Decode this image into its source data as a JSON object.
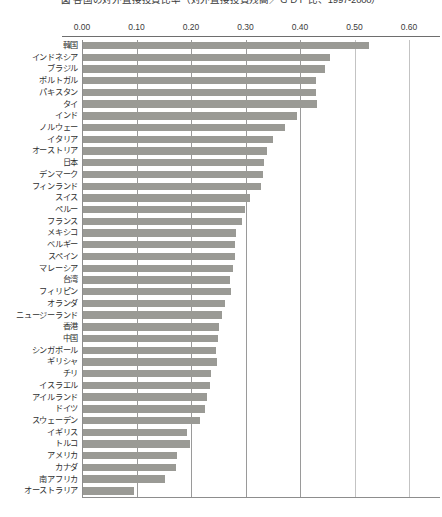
{
  "chart_title": "図 各国の対外直接投資比率（対外直接投資残高／ＧＤＰ比、1997-2000）",
  "axis": {
    "ticks": [
      "0.00",
      "0.10",
      "0.20",
      "0.30",
      "0.40",
      "0.50",
      "0.60"
    ],
    "tick_values": [
      0.0,
      0.1,
      0.2,
      0.3,
      0.4,
      0.5,
      0.6
    ]
  },
  "chart_data": {
    "type": "bar",
    "orientation": "horizontal",
    "title": "図 各国の対外直接投資比率（対外直接投資残高／ＧＤＰ比、1997-2000）",
    "xlabel": "",
    "ylabel": "",
    "xlim": [
      0.0,
      0.6
    ],
    "grid": true,
    "legend": "none",
    "categories": [
      "韓国",
      "インドネシア",
      "ブラジル",
      "ポルトガル",
      "パキスタン",
      "タイ",
      "インド",
      "ノルウェー",
      "イタリア",
      "オーストリア",
      "日本",
      "デンマーク",
      "フィンランド",
      "スイス",
      "ペルー",
      "フランス",
      "メキシコ",
      "ベルギー",
      "スペイン",
      "マレーシア",
      "台湾",
      "フィリピン",
      "オランダ",
      "ニュージーランド",
      "香港",
      "中国",
      "シンガポール",
      "ギリシャ",
      "チリ",
      "イスラエル",
      "アイルランド",
      "ドイツ",
      "スウェーデン",
      "イギリス",
      "トルコ",
      "アメリカ",
      "カナダ",
      "南アフリカ",
      "オーストラリア"
    ],
    "values": [
      0.525,
      0.453,
      0.444,
      0.427,
      0.427,
      0.429,
      0.393,
      0.37,
      0.348,
      0.337,
      0.332,
      0.33,
      0.326,
      0.307,
      0.298,
      0.291,
      0.281,
      0.278,
      0.278,
      0.276,
      0.27,
      0.272,
      0.261,
      0.255,
      0.25,
      0.248,
      0.244,
      0.246,
      0.235,
      0.233,
      0.228,
      0.224,
      0.215,
      0.191,
      0.196,
      0.172,
      0.17,
      0.15,
      0.093
    ]
  }
}
